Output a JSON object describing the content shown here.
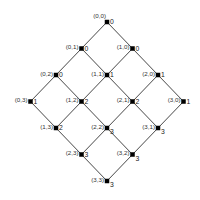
{
  "diagram": {
    "type": "lattice",
    "colors": {
      "edge": "#333333",
      "node": "#000000",
      "text": "#333333",
      "background": "#ffffff"
    },
    "geometry": {
      "origin_x": 107,
      "origin_y": 22,
      "dx": 25.5,
      "dy": 26.5,
      "node_size": 4.5
    },
    "nodes": [
      {
        "i": 0,
        "j": 0,
        "label": "(0,0)",
        "value": "0"
      },
      {
        "i": 0,
        "j": 1,
        "label": "(0,1)",
        "value": "0"
      },
      {
        "i": 1,
        "j": 0,
        "label": "(1,0)",
        "value": "0"
      },
      {
        "i": 0,
        "j": 2,
        "label": "(0,2)",
        "value": "0"
      },
      {
        "i": 1,
        "j": 1,
        "label": "(1,1)",
        "value": "1"
      },
      {
        "i": 2,
        "j": 0,
        "label": "(2,0)",
        "value": "1"
      },
      {
        "i": 0,
        "j": 3,
        "label": "(0,3)",
        "value": "1"
      },
      {
        "i": 1,
        "j": 2,
        "label": "(1,2)",
        "value": "2"
      },
      {
        "i": 2,
        "j": 1,
        "label": "(2,1)",
        "value": "2"
      },
      {
        "i": 3,
        "j": 0,
        "label": "(3,0)",
        "value": "1"
      },
      {
        "i": 1,
        "j": 3,
        "label": "(1,3)",
        "value": "2"
      },
      {
        "i": 2,
        "j": 2,
        "label": "(2,2)",
        "value": "3"
      },
      {
        "i": 3,
        "j": 1,
        "label": "(3,1)",
        "value": "3"
      },
      {
        "i": 2,
        "j": 3,
        "label": "(2,3)",
        "value": "3"
      },
      {
        "i": 3,
        "j": 2,
        "label": "(3,2)",
        "value": "3"
      },
      {
        "i": 3,
        "j": 3,
        "label": "(3,3)",
        "value": "3"
      }
    ]
  }
}
